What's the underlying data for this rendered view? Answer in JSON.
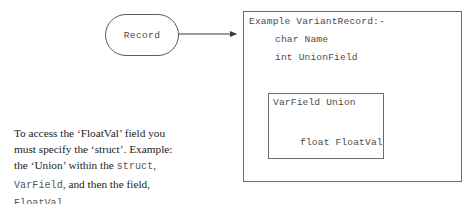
{
  "diagram": {
    "node": {
      "label": "Record"
    },
    "struct_box": {
      "header": "Example VariantRecord:-",
      "members": [
        "char Name",
        "int UnionField"
      ],
      "union_box": {
        "header": "VarField Union",
        "members": [
          "float FloatVal"
        ]
      }
    },
    "colors": {
      "box_border": "#6b6b6b",
      "node_border": "#5a5a5a",
      "code_text": "#4c4c4c",
      "note_text": "#1c1c1c",
      "mono_inline": "#555555",
      "connector": "#3a3a3a",
      "background": "#ffffff"
    }
  },
  "note": {
    "line1": "To access the ‘FloatVal’ field you",
    "line2": "must specify the ‘struct’. Example:",
    "line3_a": "the ‘Union’ within the ",
    "line3_mono": "struct",
    "line3_b": ",",
    "line4_mono": "VarField",
    "line4_b": ", and then the field,",
    "line5_mono": "FloatVal",
    "line5_b": "."
  }
}
